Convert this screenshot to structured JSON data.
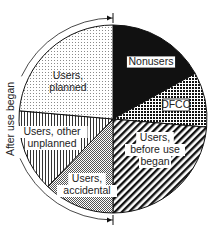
{
  "chart_data": {
    "type": "pie",
    "title": "",
    "values_are_estimated_from_angles": true,
    "start_angle_deg_clockwise_from_top": 0,
    "slices": [
      {
        "label": "Nonusers",
        "label_lines": [
          "Nonusers"
        ],
        "start_deg": 0,
        "end_deg": 61,
        "share_pct_est": 17.0,
        "pattern": "solid-black",
        "label_box": "bordered"
      },
      {
        "label": "DFCO",
        "label_lines": [
          "DFCO"
        ],
        "start_deg": 61,
        "end_deg": 95,
        "share_pct_est": 9.4,
        "pattern": "dense-dot-grid",
        "label_box": "bordered"
      },
      {
        "label": "Users, before use began",
        "label_lines": [
          "Users,",
          "before use",
          "began"
        ],
        "start_deg": 95,
        "end_deg": 180,
        "share_pct_est": 23.6,
        "pattern": "diagonal-stripes",
        "label_box": "white"
      },
      {
        "label": "Users, accidental",
        "label_lines": [
          "Users,",
          "accidental"
        ],
        "start_deg": 180,
        "end_deg": 224,
        "share_pct_est": 12.2,
        "pattern": "checkerboard",
        "label_box": "white"
      },
      {
        "label": "Users, other unplanned",
        "label_lines": [
          "Users, other",
          "unplanned"
        ],
        "start_deg": 224,
        "end_deg": 275,
        "share_pct_est": 14.2,
        "pattern": "vertical-lines",
        "label_box": "white"
      },
      {
        "label": "Users, planned",
        "label_lines": [
          "Users,",
          "planned"
        ],
        "start_deg": 275,
        "end_deg": 360,
        "share_pct_est": 23.6,
        "pattern": "light-dots",
        "label_box": "none"
      }
    ],
    "annotation": {
      "text": "After use began",
      "type": "bracket-arc",
      "spans_slices": [
        "Users, accidental",
        "Users, other unplanned",
        "Users, planned"
      ],
      "arc_from_deg": 180,
      "arc_to_deg": 360
    },
    "legend": "none",
    "geometry": {
      "cx": 113,
      "cy": 119,
      "r": 94,
      "annotation_r": 101
    }
  }
}
